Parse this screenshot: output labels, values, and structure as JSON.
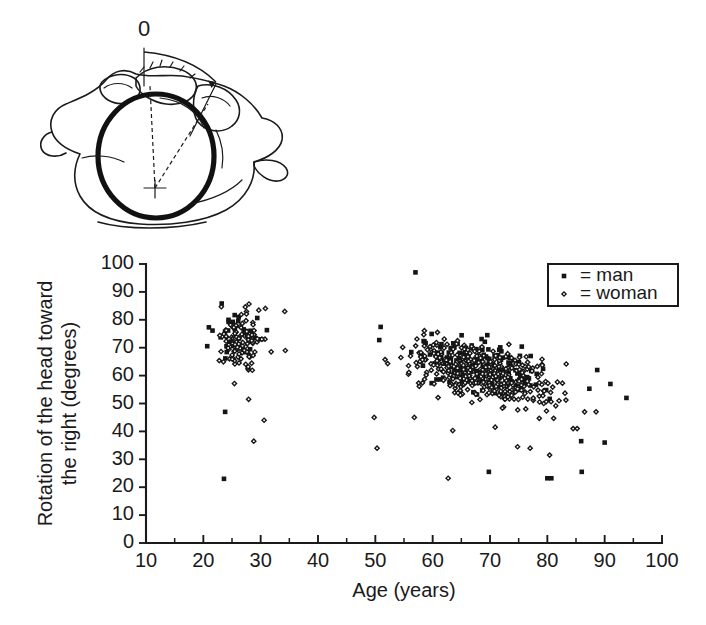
{
  "figure": {
    "caption_zero_marker": "0"
  },
  "inset": {
    "name": "vertebra-rotation-diagram",
    "zero_label": "0",
    "description": "superior view of atlas vertebra with rotation angle arc"
  },
  "chart_data": {
    "type": "scatter",
    "title": "",
    "xlabel": "Age (years)",
    "ylabel": "Rotation of the head toward the right (degrees)",
    "ylabel_line1": "Rotation of the head toward",
    "ylabel_line2": "the right (degrees)",
    "xlim": [
      10,
      100
    ],
    "ylim": [
      0,
      100
    ],
    "xticks": [
      10,
      20,
      30,
      40,
      50,
      60,
      70,
      80,
      90,
      100
    ],
    "yticks": [
      0,
      10,
      20,
      30,
      40,
      50,
      60,
      70,
      80,
      90,
      100
    ],
    "x_minor_tick_step": 5,
    "grid": false,
    "legend_position": "top-right",
    "series": [
      {
        "name": "man",
        "legend_label": "= man",
        "marker": "filled-square",
        "color": "#151515",
        "points_spec": {
          "clusters": [
            {
              "n": 34,
              "x_mean": 26.0,
              "x_sd": 3.2,
              "x_min": 20,
              "x_max": 33,
              "y_mean": 75.0,
              "y_sd": 8.5,
              "y_min": 46,
              "y_max": 93
            },
            {
              "n": 150,
              "x_mean": 68.0,
              "x_sd": 10.5,
              "x_min": 49,
              "x_max": 94,
              "y_base": 72.0,
              "y_slope": -0.42,
              "y_ref_x": 50,
              "y_sd": 8.0,
              "y_min": 35,
              "y_max": 97
            }
          ],
          "outliers": [
            {
              "x": 23.6,
              "y": 23.0
            },
            {
              "x": 23.8,
              "y": 47.0
            },
            {
              "x": 57.0,
              "y": 97.0
            },
            {
              "x": 69.8,
              "y": 25.5
            },
            {
              "x": 80.0,
              "y": 23.2
            },
            {
              "x": 80.7,
              "y": 23.2
            },
            {
              "x": 86.0,
              "y": 25.5
            },
            {
              "x": 88.7,
              "y": 62.0
            },
            {
              "x": 91.0,
              "y": 57.0
            },
            {
              "x": 93.8,
              "y": 52.0
            },
            {
              "x": 85.9,
              "y": 36.5
            },
            {
              "x": 90.0,
              "y": 36.0
            }
          ]
        }
      },
      {
        "name": "woman",
        "legend_label": "= woman",
        "marker": "open-diamond",
        "color": "#151515",
        "points_spec": {
          "clusters": [
            {
              "n": 108,
              "x_mean": 26.5,
              "x_sd": 3.4,
              "x_min": 20,
              "x_max": 34,
              "y_mean": 71.5,
              "y_sd": 9.0,
              "y_min": 36,
              "y_max": 93
            },
            {
              "n": 430,
              "x_mean": 68.5,
              "x_sd": 9.8,
              "x_min": 49,
              "x_max": 90,
              "y_base": 69.5,
              "y_slope": -0.48,
              "y_ref_x": 50,
              "y_sd": 8.2,
              "y_min": 31,
              "y_max": 90
            }
          ],
          "outliers": [
            {
              "x": 28.8,
              "y": 36.5
            },
            {
              "x": 30.6,
              "y": 44.0
            },
            {
              "x": 27.9,
              "y": 51.5
            },
            {
              "x": 34.3,
              "y": 69.0
            },
            {
              "x": 34.2,
              "y": 83.0
            },
            {
              "x": 50.3,
              "y": 34.0
            },
            {
              "x": 49.8,
              "y": 45.0
            },
            {
              "x": 56.8,
              "y": 45.0
            },
            {
              "x": 62.7,
              "y": 23.2
            },
            {
              "x": 74.8,
              "y": 34.5
            },
            {
              "x": 77.0,
              "y": 34.0
            },
            {
              "x": 80.4,
              "y": 31.5
            },
            {
              "x": 84.5,
              "y": 41.0
            },
            {
              "x": 85.2,
              "y": 41.0
            },
            {
              "x": 86.5,
              "y": 47.0
            },
            {
              "x": 88.5,
              "y": 47.0
            },
            {
              "x": 63.5,
              "y": 40.3
            },
            {
              "x": 70.9,
              "y": 41.5
            }
          ]
        }
      }
    ]
  },
  "legend": {
    "entries": [
      {
        "marker": "filled-square",
        "label": "= man"
      },
      {
        "marker": "open-diamond",
        "label": "= woman"
      }
    ]
  }
}
